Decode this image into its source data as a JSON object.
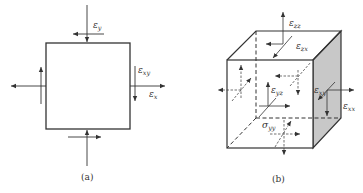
{
  "figure_a": {
    "caption": "(a)",
    "labels": {
      "eps_y": {
        "sym": "ε",
        "sub": "y"
      },
      "eps_xy": {
        "sym": "ε",
        "sub": "xy"
      },
      "eps_x": {
        "sym": "ε",
        "sub": "x"
      }
    }
  },
  "figure_b": {
    "caption": "(b)",
    "labels": {
      "eps_zz": {
        "sym": "ε",
        "sub": "zz"
      },
      "eps_zx": {
        "sym": "ε",
        "sub": "zx"
      },
      "eps_yz": {
        "sym": "ε",
        "sub": "yz"
      },
      "eps_xy": {
        "sym": "ε",
        "sub": "xy"
      },
      "eps_xx": {
        "sym": "ε",
        "sub": "xx"
      },
      "sigma_yy": {
        "sym": "σ",
        "sub": "yy"
      }
    },
    "colors": {
      "shaded_face": "#c8c8c8",
      "stroke": "#333333"
    }
  }
}
